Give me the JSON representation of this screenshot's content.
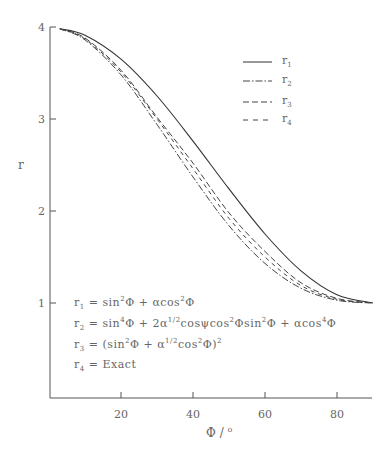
{
  "chart_data": {
    "type": "line",
    "title": "",
    "xlabel": "Φ / °",
    "ylabel": "r",
    "xlim": [
      0,
      90
    ],
    "ylim": [
      0,
      4
    ],
    "x_ticks": [
      20,
      40,
      60,
      80
    ],
    "y_ticks": [
      1,
      2,
      3,
      4
    ],
    "grid": false,
    "legend_position": "upper right",
    "x": [
      3,
      10,
      20,
      30,
      40,
      50,
      60,
      70,
      80,
      90
    ],
    "series": [
      {
        "name": "r1",
        "style": "solid",
        "values": [
          3.98,
          3.91,
          3.65,
          3.25,
          2.76,
          2.24,
          1.75,
          1.35,
          1.09,
          1.0
        ]
      },
      {
        "name": "r2",
        "style": "dash-dot",
        "values": [
          3.98,
          3.86,
          3.48,
          2.94,
          2.37,
          1.84,
          1.43,
          1.16,
          1.03,
          1.0
        ]
      },
      {
        "name": "r3",
        "style": "dash-dash",
        "values": [
          3.98,
          3.88,
          3.53,
          3.02,
          2.52,
          1.98,
          1.56,
          1.22,
          1.05,
          1.0
        ]
      },
      {
        "name": "r4",
        "style": "dashed",
        "values": [
          3.98,
          3.87,
          3.51,
          3.0,
          2.46,
          1.92,
          1.5,
          1.19,
          1.04,
          1.0
        ]
      }
    ],
    "annotations": [
      "r1 = sin²Φ + αcos²Φ",
      "r2 = sin⁴Φ + 2α^(1/2)cosψcos²Φsin²Φ + αcos⁴Φ",
      "r3 = (sin²Φ + α^(1/2)cos²Φ)²",
      "r4 = Exact"
    ]
  },
  "axes": {
    "y_label": "r",
    "x_label_main": "Φ  /",
    "x_label_unit": "o",
    "x_tick_labels": [
      "20",
      "40",
      "60",
      "80"
    ],
    "y_tick_labels": [
      "1",
      "2",
      "3",
      "4"
    ]
  },
  "legend": [
    {
      "label": "r",
      "sub": "1"
    },
    {
      "label": "r",
      "sub": "2"
    },
    {
      "label": "r",
      "sub": "3"
    },
    {
      "label": "r",
      "sub": "4"
    }
  ],
  "equations": {
    "eq1": {
      "lhs": "r",
      "sub": "1",
      "text_a": " = sin",
      "sup_a": "2",
      "text_b": "Φ + αcos",
      "sup_b": "2",
      "text_c": "Φ"
    },
    "eq2": {
      "lhs": "r",
      "sub": "2",
      "text_a": " = sin",
      "sup_a": "4",
      "text_b": "Φ + 2α",
      "sup_b": "1/2",
      "text_c": "cosψcos",
      "sup_c": "2",
      "text_d": "Φsin",
      "sup_d": "2",
      "text_e": "Φ + αcos",
      "sup_e": "4",
      "text_f": "Φ"
    },
    "eq3": {
      "lhs": "r",
      "sub": "3",
      "text_a": " = (sin",
      "sup_a": "2",
      "text_b": "Φ + α",
      "sup_b": "1/2",
      "text_c": "cos",
      "sup_c": "2",
      "text_d": "Φ)",
      "sup_d": "2"
    },
    "eq4": {
      "lhs": "r",
      "sub": "4",
      "text_a": " = Exact"
    }
  },
  "colors": {
    "line": "#333333",
    "text": "#666666"
  }
}
